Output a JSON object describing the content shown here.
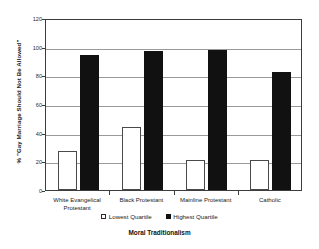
{
  "chart_data": {
    "type": "bar",
    "title": "",
    "subtitle": "",
    "xlabel": "Moral Traditionalism",
    "ylabel": "% \"Gay Marriage Should Not Be Allowed\"",
    "categories": [
      "White Evangelical Protestant",
      "Black Protestant",
      "Mainline Protestant",
      "Catholic"
    ],
    "category_lines": [
      [
        "White Evangelical",
        "Protestant"
      ],
      [
        "Black Protestant"
      ],
      [
        "Mainline Protestant"
      ],
      [
        "Catholic"
      ]
    ],
    "series": [
      {
        "name": "Lowest Quartile",
        "color": "#ffffff",
        "edge_color": "#4a4a4a",
        "values": [
          27,
          44,
          21,
          21
        ]
      },
      {
        "name": "Highest Quartile",
        "color": "#111111",
        "edge_color": "#111111",
        "values": [
          94,
          97,
          97.5,
          82
        ]
      }
    ],
    "ylim": [
      0,
      120
    ],
    "yticks": [
      0,
      20,
      40,
      60,
      80,
      100,
      120
    ],
    "ytick_labels": [
      "0",
      "20",
      "40",
      "60",
      "80",
      "100",
      "120"
    ],
    "grid": true,
    "grid_axis": "y",
    "legend_position": "below-axis-center",
    "frame": true,
    "background_color": "#ffffff",
    "grid_color": "#9a9a9a",
    "axis_color": "#3c3c3c"
  }
}
